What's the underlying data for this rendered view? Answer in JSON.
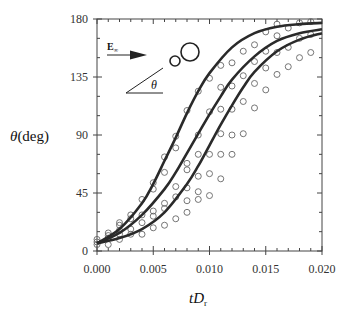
{
  "chart_data": {
    "type": "scatter",
    "title": "",
    "xlabel": "tD_r",
    "xlabel_main": "tD",
    "xlabel_sub": "r",
    "ylabel": "θ (deg)",
    "ylabel_symbol": "θ",
    "ylabel_unit": "(deg)",
    "xlim": [
      0.0,
      0.02
    ],
    "ylim": [
      0,
      180
    ],
    "xticks": [
      "0.000",
      "0.005",
      "0.010",
      "0.015",
      "0.020"
    ],
    "xtick_values": [
      0.0,
      0.005,
      0.01,
      0.015,
      0.02
    ],
    "yticks": [
      "0",
      "45",
      "90",
      "135",
      "180"
    ],
    "ytick_values": [
      0,
      45,
      90,
      135,
      180
    ],
    "grid": false,
    "legend": "none",
    "inset": {
      "field_label": "E∞",
      "field_symbol": "E",
      "field_sub": "∞",
      "angle_label": "θ"
    },
    "series": [
      {
        "name": "fit-1",
        "kind": "line",
        "x": [
          0.0,
          0.002,
          0.004,
          0.005,
          0.006,
          0.007,
          0.008,
          0.009,
          0.01,
          0.012,
          0.014,
          0.016,
          0.018,
          0.02
        ],
        "y": [
          6,
          17,
          37,
          52,
          70,
          88,
          107,
          124,
          138,
          158,
          169,
          174,
          176,
          177
        ]
      },
      {
        "name": "fit-2",
        "kind": "line",
        "x": [
          0.0,
          0.002,
          0.004,
          0.006,
          0.007,
          0.008,
          0.009,
          0.01,
          0.011,
          0.012,
          0.014,
          0.016,
          0.018,
          0.02
        ],
        "y": [
          6,
          14,
          28,
          48,
          61,
          76,
          91,
          106,
          120,
          133,
          151,
          163,
          169,
          172
        ]
      },
      {
        "name": "fit-3",
        "kind": "line",
        "x": [
          0.0,
          0.002,
          0.004,
          0.006,
          0.008,
          0.009,
          0.01,
          0.011,
          0.012,
          0.013,
          0.014,
          0.016,
          0.018,
          0.02
        ],
        "y": [
          6,
          10,
          17,
          30,
          52,
          66,
          82,
          98,
          113,
          127,
          139,
          155,
          164,
          169
        ]
      },
      {
        "name": "measurements",
        "kind": "scatter",
        "x": [
          0.0,
          0.0,
          0.0,
          0.001,
          0.001,
          0.001,
          0.001,
          0.002,
          0.002,
          0.002,
          0.002,
          0.002,
          0.003,
          0.003,
          0.003,
          0.003,
          0.004,
          0.004,
          0.004,
          0.004,
          0.005,
          0.005,
          0.005,
          0.005,
          0.005,
          0.006,
          0.006,
          0.006,
          0.006,
          0.006,
          0.007,
          0.007,
          0.007,
          0.007,
          0.007,
          0.008,
          0.008,
          0.008,
          0.008,
          0.008,
          0.008,
          0.009,
          0.009,
          0.009,
          0.009,
          0.009,
          0.009,
          0.01,
          0.01,
          0.01,
          0.01,
          0.01,
          0.011,
          0.011,
          0.011,
          0.011,
          0.011,
          0.011,
          0.012,
          0.012,
          0.012,
          0.012,
          0.012,
          0.013,
          0.013,
          0.013,
          0.013,
          0.014,
          0.014,
          0.014,
          0.014,
          0.015,
          0.015,
          0.015,
          0.015,
          0.016,
          0.016,
          0.016,
          0.016,
          0.017,
          0.017,
          0.017,
          0.018,
          0.018,
          0.018,
          0.019,
          0.019,
          0.019
        ],
        "y": [
          5,
          7,
          9,
          5,
          10,
          12,
          14,
          9,
          13,
          16,
          20,
          22,
          13,
          17,
          25,
          28,
          13,
          22,
          28,
          40,
          18,
          27,
          31,
          48,
          53,
          20,
          33,
          37,
          61,
          73,
          25,
          42,
          50,
          80,
          89,
          30,
          39,
          49,
          63,
          68,
          109,
          40,
          46,
          58,
          75,
          90,
          124,
          43,
          60,
          75,
          108,
          134,
          56,
          75,
          91,
          110,
          127,
          144,
          75,
          90,
          110,
          128,
          146,
          91,
          116,
          136,
          155,
          111,
          130,
          147,
          160,
          125,
          142,
          155,
          170,
          137,
          154,
          167,
          176,
          143,
          158,
          173,
          150,
          165,
          177,
          154,
          168,
          178
        ]
      }
    ]
  }
}
